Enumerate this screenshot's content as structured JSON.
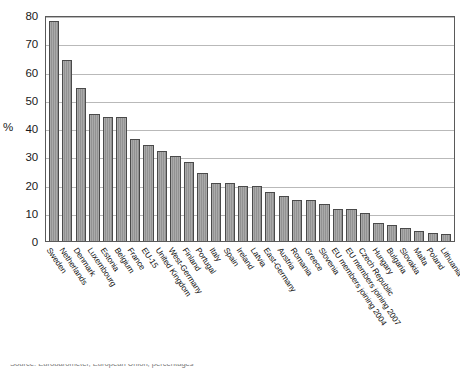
{
  "chart_data": {
    "type": "bar",
    "title": "",
    "xlabel": "",
    "ylabel": "%",
    "ylim": [
      0,
      80
    ],
    "ytick_values": [
      0,
      10,
      20,
      30,
      40,
      50,
      60,
      70,
      80
    ],
    "ytick_labels": [
      "0",
      "10",
      "20",
      "30",
      "40",
      "50",
      "60",
      "70",
      "80"
    ],
    "grid": true,
    "legend": null,
    "orientation": "vertical",
    "bar_color": "#9a9a9a",
    "bar_border_color": "#4a4a4a",
    "categories": [
      "Sweden",
      "Netherlands",
      "Denmark",
      "Luxembourg",
      "Estonia",
      "Belgium",
      "France",
      "EU-15",
      "United Kingdom",
      "West-Germany",
      "Finland",
      "Portugal",
      "Italy",
      "Spain",
      "Ireland",
      "Latvia",
      "East-Germany",
      "Austria",
      "Romania",
      "Greece",
      "Slovenia",
      "EU members joining 2004",
      "EU members joining 2007",
      "Czech Republic",
      "Hungary",
      "Bulgaria",
      "Slovakia",
      "Malta",
      "Poland",
      "Lithuania"
    ],
    "values": [
      78,
      64,
      54,
      45,
      44,
      44,
      36,
      34,
      32,
      30,
      28,
      24,
      20.5,
      20.5,
      19.5,
      19.5,
      17.5,
      16,
      14.5,
      14.5,
      13,
      11.5,
      11.5,
      10,
      6.5,
      5.5,
      4.5,
      3.5,
      3,
      2.5
    ]
  },
  "chart": {
    "y_axis_title": "%"
  },
  "source_note": {
    "text": "Source: Eurobarometer, European Union, percentages"
  }
}
